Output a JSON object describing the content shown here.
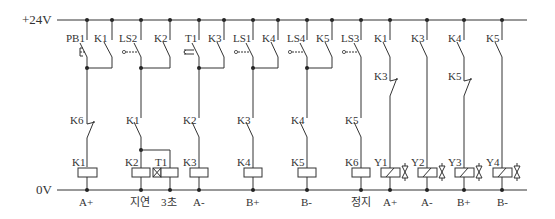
{
  "diagram": {
    "type": "ladder-diagram",
    "top_bus_label": "+24V",
    "bottom_bus_label": "0V",
    "rungs": [
      {
        "id": "r1",
        "contacts": [
          {
            "label": "PB1",
            "type": "NO-pushbutton"
          },
          {
            "label": "K1",
            "type": "NO-parallel"
          },
          {
            "label": "K6",
            "type": "NC"
          }
        ],
        "coil": "K1",
        "output_label": "A+"
      },
      {
        "id": "r2",
        "contacts": [
          {
            "label": "LS2",
            "type": "NO-limit"
          },
          {
            "label": "K2",
            "type": "NO-parallel"
          },
          {
            "label": "K1",
            "type": "NO"
          }
        ],
        "coil": "K2",
        "coil2": "T1",
        "output_label": "지연",
        "output_label2": "3초"
      },
      {
        "id": "r3",
        "contacts": [
          {
            "label": "T1",
            "type": "NO-timer"
          },
          {
            "label": "K3",
            "type": "NO-parallel"
          },
          {
            "label": "K2",
            "type": "NO"
          }
        ],
        "coil": "K3",
        "output_label": "A-"
      },
      {
        "id": "r4",
        "contacts": [
          {
            "label": "LS1",
            "type": "NO-limit"
          },
          {
            "label": "K4",
            "type": "NO-parallel"
          },
          {
            "label": "K3",
            "type": "NO"
          }
        ],
        "coil": "K4",
        "output_label": "B+"
      },
      {
        "id": "r5",
        "contacts": [
          {
            "label": "LS4",
            "type": "NO-limit"
          },
          {
            "label": "K5",
            "type": "NO-parallel"
          },
          {
            "label": "K4",
            "type": "NO"
          }
        ],
        "coil": "K5",
        "output_label": "B-"
      },
      {
        "id": "r6",
        "contacts": [
          {
            "label": "LS3",
            "type": "NO-limit"
          },
          {
            "label": "K5",
            "type": "NO"
          }
        ],
        "coil": "K6",
        "output_label": "정지"
      },
      {
        "id": "r7",
        "contacts": [
          {
            "label": "K1",
            "type": "NO"
          },
          {
            "label": "K3",
            "type": "NC"
          }
        ],
        "coil": "Y1",
        "output_label": "A+"
      },
      {
        "id": "r8",
        "contacts": [
          {
            "label": "K3",
            "type": "NO"
          }
        ],
        "coil": "Y2",
        "output_label": "A-"
      },
      {
        "id": "r9",
        "contacts": [
          {
            "label": "K4",
            "type": "NO"
          },
          {
            "label": "K5",
            "type": "NC"
          }
        ],
        "coil": "Y3",
        "output_label": "B+"
      },
      {
        "id": "r10",
        "contacts": [
          {
            "label": "K5",
            "type": "NO"
          }
        ],
        "coil": "Y4",
        "output_label": "B-"
      }
    ]
  },
  "labels": {
    "top_bus": "+24V",
    "bottom_bus": "0V",
    "r1": {
      "c1": "PB1",
      "c2": "K1",
      "c3": "K6",
      "coil": "K1",
      "out": "A+"
    },
    "r2": {
      "c1": "LS2",
      "c2": "K2",
      "c3": "K1",
      "coil": "K2",
      "coil2": "T1",
      "out": "지연",
      "out2": "3초"
    },
    "r3": {
      "c1": "T1",
      "c2": "K3",
      "c3": "K2",
      "coil": "K3",
      "out": "A-"
    },
    "r4": {
      "c1": "LS1",
      "c2": "K4",
      "c3": "K3",
      "coil": "K4",
      "out": "B+"
    },
    "r5": {
      "c1": "LS4",
      "c2": "K5",
      "c3": "K4",
      "coil": "K5",
      "out": "B-"
    },
    "r6": {
      "c1": "LS3",
      "c3": "K5",
      "coil": "K6",
      "out": "정지"
    },
    "r7": {
      "c1": "K1",
      "c2": "K3",
      "coil": "Y1",
      "out": "A+"
    },
    "r8": {
      "c1": "K3",
      "coil": "Y2",
      "out": "A-"
    },
    "r9": {
      "c1": "K4",
      "c2": "K5",
      "coil": "Y3",
      "out": "B+"
    },
    "r10": {
      "c1": "K5",
      "coil": "Y4",
      "out": "B-"
    }
  }
}
